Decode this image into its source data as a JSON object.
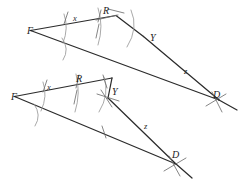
{
  "figure": {
    "title": "",
    "background_color": "#ffffff",
    "ink_color": "#2b2b2b",
    "construction_color": "#9a9a9a",
    "constructions": [
      {
        "name": "upper-construction",
        "vertices": [
          {
            "label": "F",
            "x": 30,
            "y": 30
          },
          {
            "label": "R",
            "x": 104,
            "y": 17
          },
          {
            "label": "Y",
            "x": 143,
            "y": 36
          },
          {
            "label": "D",
            "x": 218,
            "y": 99
          }
        ],
        "segment_labels": [
          {
            "label": "x",
            "x": 76,
            "y": 22
          },
          {
            "label": "z",
            "x": 186,
            "y": 72
          }
        ],
        "vertex_label_offsets": [
          {
            "label": "F",
            "x": 39,
            "y": 34
          },
          {
            "label": "R",
            "x": 103,
            "y": 18
          },
          {
            "label": "Y",
            "x": 151,
            "y": 40
          },
          {
            "label": "D",
            "x": 215,
            "y": 101
          }
        ]
      },
      {
        "name": "lower-construction",
        "vertices": [
          {
            "label": "F",
            "x": 14,
            "y": 96
          },
          {
            "label": "R",
            "x": 77,
            "y": 85
          },
          {
            "label": "Y",
            "x": 108,
            "y": 98
          },
          {
            "label": "D",
            "x": 175,
            "y": 163
          }
        ],
        "segment_labels": [
          {
            "label": "x",
            "x": 50,
            "y": 90
          },
          {
            "label": "z",
            "x": 146,
            "y": 127
          }
        ],
        "vertex_label_offsets": [
          {
            "label": "F",
            "x": 21,
            "y": 100
          },
          {
            "label": "R",
            "x": 78,
            "y": 85
          },
          {
            "label": "Y",
            "x": 113,
            "y": 95
          },
          {
            "label": "D",
            "x": 176,
            "y": 158
          }
        ]
      }
    ],
    "labels_used": [
      "F",
      "R",
      "Y",
      "D",
      "x",
      "z"
    ]
  }
}
